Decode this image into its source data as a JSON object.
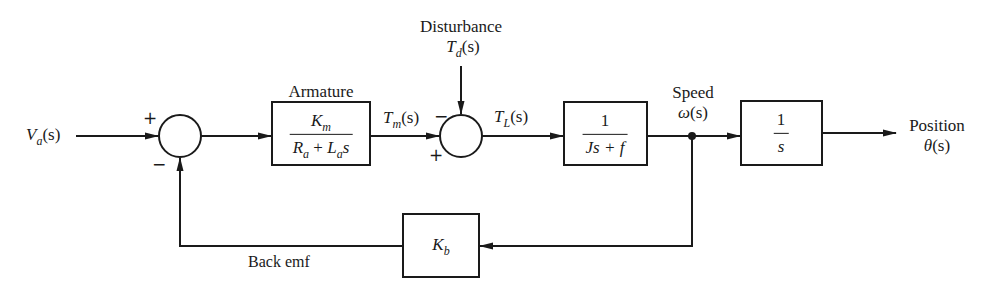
{
  "diagram": {
    "type": "block-diagram",
    "colors": {
      "line": "#1a1a1a",
      "background": "#ffffff"
    },
    "input": {
      "symbol": "V",
      "sub": "a",
      "arg": "(s)"
    },
    "summing_junction_1": {
      "plus_sign": "+",
      "minus_sign": "−"
    },
    "armature_block": {
      "label": "Armature",
      "numerator": {
        "symbol": "K",
        "sub": "m"
      },
      "denominator": {
        "r": "R",
        "r_sub": "a",
        "plus": " + ",
        "l": "L",
        "l_sub": "a",
        "s": "s"
      }
    },
    "tm_signal": {
      "symbol": "T",
      "sub": "m",
      "arg": "(s)"
    },
    "disturbance": {
      "label": "Disturbance",
      "symbol": "T",
      "sub": "d",
      "arg": "(s)"
    },
    "summing_junction_2": {
      "plus_sign": "+",
      "minus_sign": "−"
    },
    "tl_signal": {
      "symbol": "T",
      "sub": "L",
      "arg": "(s)"
    },
    "load_block": {
      "numerator": "1",
      "denominator": "Js + f"
    },
    "speed": {
      "label": "Speed",
      "symbol": "ω",
      "arg": "(s)"
    },
    "integrator_block": {
      "numerator": "1",
      "denominator": "s"
    },
    "output": {
      "label": "Position",
      "symbol": "θ",
      "arg": "(s)"
    },
    "feedback_block": {
      "symbol": "K",
      "sub": "b"
    },
    "feedback_label": "Back emf"
  }
}
